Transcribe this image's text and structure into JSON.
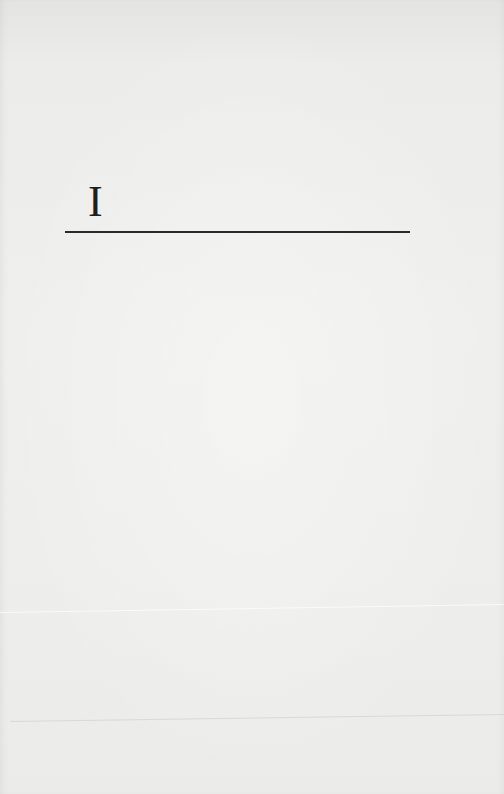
{
  "page": {
    "type": "scanned-book-page",
    "heading": {
      "numeral": "I"
    },
    "colors": {
      "paper": "#eeeeec",
      "ink": "#1e1e1e"
    }
  }
}
